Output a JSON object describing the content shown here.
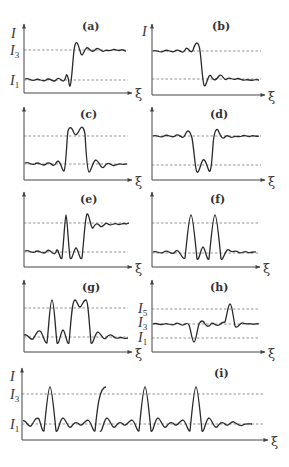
{
  "figure": {
    "axis_symbols": {
      "y": "I",
      "x": "ξ"
    },
    "levels": {
      "I1": "1",
      "I3": "3",
      "I5": "5"
    },
    "panels": [
      {
        "id": "a",
        "label": "(a)",
        "shows_y_label": true,
        "level_labels": [
          "I3",
          "I1"
        ]
      },
      {
        "id": "b",
        "label": "(b)",
        "shows_y_label": true,
        "level_labels": []
      },
      {
        "id": "c",
        "label": "(c)",
        "shows_y_label": false,
        "level_labels": []
      },
      {
        "id": "d",
        "label": "(d)",
        "shows_y_label": false,
        "level_labels": []
      },
      {
        "id": "e",
        "label": "(e)",
        "shows_y_label": false,
        "level_labels": []
      },
      {
        "id": "f",
        "label": "(f)",
        "shows_y_label": false,
        "level_labels": []
      },
      {
        "id": "g",
        "label": "(g)",
        "shows_y_label": false,
        "level_labels": []
      },
      {
        "id": "h",
        "label": "(h)",
        "shows_y_label": false,
        "level_labels": [
          "I5",
          "I3",
          "I1"
        ]
      },
      {
        "id": "i",
        "label": "(i)",
        "shows_y_label": true,
        "level_labels": [
          "I3",
          "I1"
        ]
      }
    ]
  }
}
